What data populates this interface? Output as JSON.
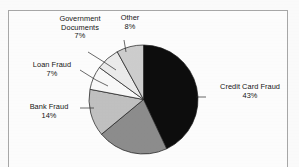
{
  "chart_data": {
    "type": "pie",
    "title": "",
    "subtitle": "",
    "xlabel": "",
    "ylabel": "",
    "legend_position": "none",
    "grid": false,
    "labels_outside": true,
    "start_angle_deg": 0,
    "direction": "clockwise",
    "categories": [
      "Credit Card Fraud",
      "",
      "Bank Fraud",
      "Loan Fraud",
      "Government Documents",
      "Other"
    ],
    "values": [
      43,
      21,
      14,
      7,
      7,
      8
    ],
    "slices": [
      {
        "name": "credit-card-fraud",
        "label": "Credit Card Fraud",
        "percent_text": "43%",
        "value": 43,
        "color": "#0d0d0d",
        "labeled": true
      },
      {
        "name": "unlabeled-slice",
        "label": "",
        "percent_text": "",
        "value": 21,
        "color": "#8e8e8e",
        "labeled": false
      },
      {
        "name": "bank-fraud",
        "label": "Bank Fraud",
        "percent_text": "14%",
        "value": 14,
        "color": "#c2c2c2",
        "labeled": true
      },
      {
        "name": "loan-fraud",
        "label": "Loan Fraud",
        "percent_text": "7%",
        "value": 7,
        "color": "#fbfbfb",
        "labeled": true
      },
      {
        "name": "government-documents",
        "label": "Government Documents",
        "percent_text": "7%",
        "value": 7,
        "color": "#ededed",
        "labeled": true
      },
      {
        "name": "other",
        "label": "Other",
        "percent_text": "8%",
        "value": 8,
        "color": "#cfcfcf",
        "labeled": true
      }
    ]
  },
  "labels": {
    "government_documents": {
      "line1": "Government",
      "line2": "Documents",
      "percent": "7%"
    },
    "other": {
      "line1": "Other",
      "percent": "8%"
    },
    "loan_fraud": {
      "line1": "Loan Fraud",
      "percent": "7%"
    },
    "bank_fraud": {
      "line1": "Bank Fraud",
      "percent": "14%"
    },
    "credit_card_fraud": {
      "line1": "Credit Card Fraud",
      "percent": "43%"
    }
  },
  "colors": {
    "frame": "#a9a9a9",
    "background": "#ffffff",
    "slice_outline": "#1a1a1a",
    "leader_line": "#2a2a2a",
    "text": "#151515"
  }
}
